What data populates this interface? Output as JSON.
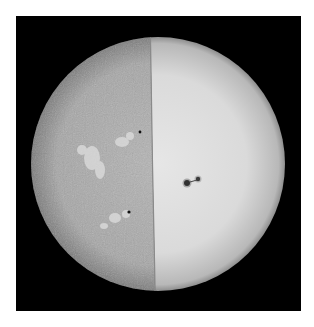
{
  "image": {
    "subject": "Sun full disc, split view",
    "left_half": "chromosphere (H-alpha, mottled with bright plage regions)",
    "right_half": "photosphere (white light, smooth with limb darkening)",
    "features": [
      {
        "name": "sunspot-group",
        "location": "right half, center",
        "x": 193,
        "y": 182
      },
      {
        "name": "small-sunspot",
        "location": "left half, upper",
        "x": 140,
        "y": 132
      },
      {
        "name": "small-sunspot",
        "location": "left half, lower",
        "x": 129,
        "y": 212
      }
    ],
    "colors": {
      "background": "#ffffff",
      "frame": "#000000",
      "chromosphere": "#a8a8a8",
      "photosphere": "#dcdcdc",
      "spot": "#111111"
    }
  }
}
